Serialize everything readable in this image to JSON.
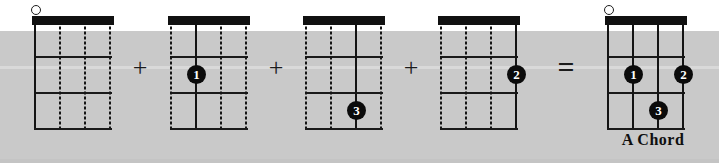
{
  "figure": {
    "background_white": "#ffffff",
    "background_grey": "#c9c9c9",
    "ink_color": "#111111",
    "dot_fill": "#0b0b0b",
    "dot_text_color": "#ffffff"
  },
  "operators": {
    "plus1": "+",
    "plus2": "+",
    "plus3": "+",
    "equals": "="
  },
  "caption": {
    "text": "A Chord"
  },
  "diagrams": [
    {
      "id": "step-1-open-string",
      "label": "",
      "strings": [
        "solid",
        "dotted",
        "dotted",
        "dotted"
      ],
      "open_markers": [
        1
      ],
      "dots": []
    },
    {
      "id": "step-2-finger-1",
      "label": "",
      "strings": [
        "dotted",
        "solid",
        "dotted",
        "dotted"
      ],
      "open_markers": [],
      "dots": [
        {
          "finger": "1",
          "string": 2,
          "fret": 2
        }
      ]
    },
    {
      "id": "step-3-finger-3",
      "label": "",
      "strings": [
        "dotted",
        "dotted",
        "solid",
        "dotted"
      ],
      "open_markers": [],
      "dots": [
        {
          "finger": "3",
          "string": 3,
          "fret": 3
        }
      ]
    },
    {
      "id": "step-4-finger-2",
      "label": "",
      "strings": [
        "dotted",
        "dotted",
        "dotted",
        "solid"
      ],
      "open_markers": [],
      "dots": [
        {
          "finger": "2",
          "string": 4,
          "fret": 2
        }
      ]
    },
    {
      "id": "result-a-chord",
      "label": "A Chord",
      "strings": [
        "solid",
        "solid",
        "solid",
        "solid"
      ],
      "open_markers": [
        1
      ],
      "dots": [
        {
          "finger": "1",
          "string": 2,
          "fret": 2
        },
        {
          "finger": "2",
          "string": 4,
          "fret": 2
        },
        {
          "finger": "3",
          "string": 3,
          "fret": 3
        }
      ]
    }
  ],
  "layout": {
    "diagram_left_positions": [
      34,
      170,
      305,
      440,
      607
    ],
    "operator_left_positions": [
      140,
      276,
      411,
      566
    ],
    "caption_left": 653
  }
}
